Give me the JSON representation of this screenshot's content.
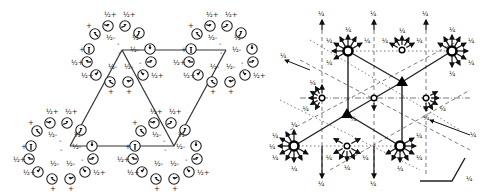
{
  "left_diagram": {
    "title": "",
    "labels": {
      "half_plus": "½+",
      "half_minus": "½-",
      "plus": "+",
      "minus": "-"
    },
    "clusters": [
      {
        "name": "top-left",
        "cx": 120,
        "cy": 48
      },
      {
        "name": "top-right",
        "cx": 222,
        "cy": 48
      },
      {
        "name": "bottom-left",
        "cx": 62,
        "cy": 145
      },
      {
        "name": "bottom-middle",
        "cx": 166,
        "cy": 145
      }
    ],
    "line_color": "#333333"
  },
  "right_diagram": {
    "arrow_label": "¼",
    "scale_label": "¼",
    "nodes": [
      {
        "type": "open-circle-large",
        "x": 348,
        "y": 51
      },
      {
        "type": "open-small",
        "x": 402,
        "y": 50
      },
      {
        "type": "open-circle-large",
        "x": 452,
        "y": 51
      },
      {
        "type": "filled-triangle",
        "x": 402,
        "y": 82
      },
      {
        "type": "open-small",
        "x": 322,
        "y": 98
      },
      {
        "type": "open-small",
        "x": 374,
        "y": 98
      },
      {
        "type": "open-small",
        "x": 426,
        "y": 98
      },
      {
        "type": "filled-triangle",
        "x": 347,
        "y": 114
      },
      {
        "type": "open-circle-large",
        "x": 294,
        "y": 146
      },
      {
        "type": "open-small",
        "x": 347,
        "y": 146
      },
      {
        "type": "open-circle-large",
        "x": 400,
        "y": 146
      }
    ],
    "line_color": "#222222"
  }
}
